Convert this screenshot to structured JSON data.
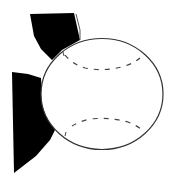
{
  "image": {
    "subject": "baseball clip art",
    "colors": {
      "background": "#ffffff",
      "ball_fill": "#ffffff",
      "outline": "#333333",
      "shadow": "#000000",
      "stitch": "#444444"
    }
  }
}
